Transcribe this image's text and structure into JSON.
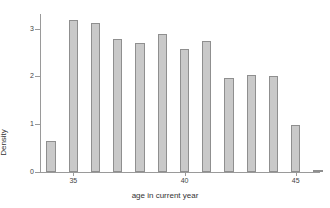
{
  "chart_data": {
    "type": "bar",
    "title": "",
    "subtitle": "",
    "xlabel": "age in current year",
    "ylabel": "Density",
    "xlim": [
      33.5,
      46.0
    ],
    "ylim": [
      0,
      3.35
    ],
    "xticks": [
      35,
      40,
      45
    ],
    "xtick_labels": [
      "35",
      "40",
      "45"
    ],
    "yticks": [
      0,
      1,
      2,
      3
    ],
    "ytick_labels": [
      "0",
      "1",
      "2",
      "3"
    ],
    "grid": false,
    "legend": null,
    "bar_fill_color": "#c9c9c9",
    "bar_edge_color": "#8f8f8f",
    "axis_color": "#9a9a9a",
    "categories": [
      "34",
      "35",
      "36",
      "37",
      "38",
      "39",
      "40",
      "41",
      "42",
      "43",
      "44",
      "45",
      "46"
    ],
    "x": [
      34,
      35,
      36,
      37,
      38,
      39,
      40,
      41,
      42,
      43,
      44,
      45,
      46
    ],
    "values": [
      0.65,
      3.18,
      3.13,
      2.78,
      2.7,
      2.88,
      2.57,
      2.75,
      1.97,
      2.03,
      2.01,
      0.99,
      0.03
    ],
    "bar_width": 0.42,
    "annotations": []
  },
  "axis": {
    "y_title": "Density",
    "x_title": "age in current year"
  }
}
